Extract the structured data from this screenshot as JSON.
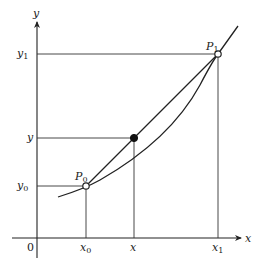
{
  "diagram": {
    "type": "linear-interpolation",
    "axes": {
      "x_label": "x",
      "y_label": "y",
      "origin_label": "0"
    },
    "x_ticks": [
      {
        "label": "x",
        "sub": "0",
        "px": 86
      },
      {
        "label": "x",
        "sub": "",
        "px": 134
      },
      {
        "label": "x",
        "sub": "1",
        "px": 218
      }
    ],
    "y_ticks": [
      {
        "label": "y",
        "sub": "1",
        "py": 54
      },
      {
        "label": "y",
        "sub": "",
        "py": 138
      },
      {
        "label": "y",
        "sub": "0",
        "py": 186
      }
    ],
    "points": {
      "P0": {
        "label": "P",
        "sub": "0",
        "x": 86,
        "y": 186,
        "style": "open-circle"
      },
      "P1": {
        "label": "P",
        "sub": "1",
        "x": 218,
        "y": 54,
        "style": "open-circle"
      },
      "interpolated": {
        "x": 134,
        "y": 138,
        "style": "filled-circle"
      }
    },
    "elements": [
      "curve",
      "secant-line P0-P1",
      "projection lines"
    ],
    "colors": {
      "stroke": "#222222",
      "background": "#ffffff"
    }
  }
}
